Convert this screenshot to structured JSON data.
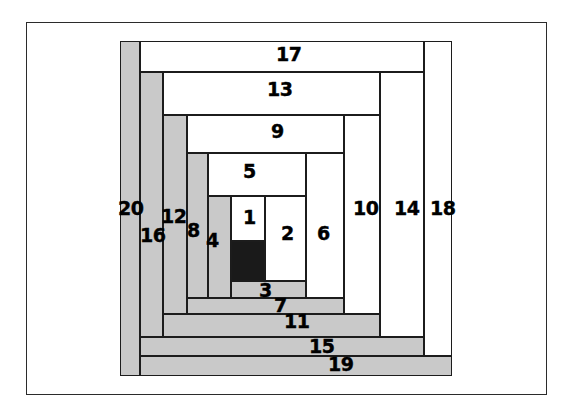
{
  "figure": {
    "kind": "log-cabin-quilt-block-diagram",
    "background_color": "#ffffff",
    "frame_color": "#2b2b2b",
    "outline_color": "#1c1c1c",
    "light_color": "#ffffff",
    "shade_color": "#c9c9c9",
    "dark_color": "#1a1a1a"
  },
  "pieces": [
    {
      "label": "1",
      "shade": "light",
      "x": 231,
      "y": 196,
      "w": 34,
      "h": 45
    },
    {
      "label": "2",
      "shade": "light",
      "x": 265,
      "y": 196,
      "w": 41,
      "h": 85
    },
    {
      "label": "3",
      "shade": "shade",
      "x": 231,
      "y": 281,
      "w": 75,
      "h": 17
    },
    {
      "label": "4",
      "shade": "shade",
      "x": 208,
      "y": 196,
      "w": 23,
      "h": 102
    },
    {
      "label": "5",
      "shade": "light",
      "x": 208,
      "y": 153,
      "w": 98,
      "h": 43
    },
    {
      "label": "6",
      "shade": "light",
      "x": 306,
      "y": 153,
      "w": 38,
      "h": 145
    },
    {
      "label": "7",
      "shade": "shade",
      "x": 187,
      "y": 298,
      "w": 157,
      "h": 16
    },
    {
      "label": "8",
      "shade": "shade",
      "x": 187,
      "y": 153,
      "w": 21,
      "h": 145
    },
    {
      "label": "9",
      "shade": "light",
      "x": 187,
      "y": 115,
      "w": 157,
      "h": 38
    },
    {
      "label": "10",
      "shade": "light",
      "x": 344,
      "y": 115,
      "w": 36,
      "h": 199
    },
    {
      "label": "11",
      "shade": "shade",
      "x": 163,
      "y": 314,
      "w": 217,
      "h": 23
    },
    {
      "label": "12",
      "shade": "shade",
      "x": 163,
      "y": 115,
      "w": 24,
      "h": 199
    },
    {
      "label": "13",
      "shade": "light",
      "x": 163,
      "y": 72,
      "w": 217,
      "h": 43
    },
    {
      "label": "14",
      "shade": "light",
      "x": 380,
      "y": 72,
      "w": 44,
      "h": 265
    },
    {
      "label": "15",
      "shade": "shade",
      "x": 140,
      "y": 337,
      "w": 284,
      "h": 19
    },
    {
      "label": "16",
      "shade": "shade",
      "x": 140,
      "y": 72,
      "w": 23,
      "h": 265
    },
    {
      "label": "17",
      "shade": "light",
      "x": 140,
      "y": 41,
      "w": 284,
      "h": 31
    },
    {
      "label": "18",
      "shade": "light",
      "x": 424,
      "y": 41,
      "w": 28,
      "h": 315
    },
    {
      "label": "19",
      "shade": "shade",
      "x": 140,
      "y": 356,
      "w": 312,
      "h": 20
    },
    {
      "label": "20",
      "shade": "shade",
      "x": 120,
      "y": 41,
      "w": 20,
      "h": 335
    }
  ],
  "center_square": {
    "name": "center-dark-square",
    "shade": "dark",
    "x": 231,
    "y": 241,
    "w": 34,
    "h": 40
  },
  "labels": [
    {
      "text": "17",
      "x": 276,
      "y": 45
    },
    {
      "text": "13",
      "x": 267,
      "y": 80
    },
    {
      "text": "9",
      "x": 271,
      "y": 122
    },
    {
      "text": "5",
      "x": 243,
      "y": 162
    },
    {
      "text": "1",
      "x": 243,
      "y": 208
    },
    {
      "text": "2",
      "x": 281,
      "y": 224
    },
    {
      "text": "6",
      "x": 317,
      "y": 224
    },
    {
      "text": "10",
      "x": 353,
      "y": 199
    },
    {
      "text": "14",
      "x": 394,
      "y": 199
    },
    {
      "text": "18",
      "x": 430,
      "y": 199
    },
    {
      "text": "20",
      "x": 118,
      "y": 199
    },
    {
      "text": "16",
      "x": 140,
      "y": 226
    },
    {
      "text": "12",
      "x": 161,
      "y": 207
    },
    {
      "text": "8",
      "x": 187,
      "y": 221
    },
    {
      "text": "4",
      "x": 206,
      "y": 231
    },
    {
      "text": "3",
      "x": 259,
      "y": 281
    },
    {
      "text": "7",
      "x": 274,
      "y": 296
    },
    {
      "text": "11",
      "x": 284,
      "y": 312
    },
    {
      "text": "15",
      "x": 309,
      "y": 337
    },
    {
      "text": "19",
      "x": 328,
      "y": 355
    }
  ],
  "chart_data": {
    "type": "diagram",
    "categories": [
      "1",
      "2",
      "3",
      "4",
      "5",
      "6",
      "7",
      "8",
      "9",
      "10",
      "11",
      "12",
      "13",
      "14",
      "15",
      "16",
      "17",
      "18",
      "19",
      "20"
    ],
    "values": [
      1,
      2,
      3,
      4,
      5,
      6,
      7,
      8,
      9,
      10,
      11,
      12,
      13,
      14,
      15,
      16,
      17,
      18,
      19,
      20
    ]
  }
}
